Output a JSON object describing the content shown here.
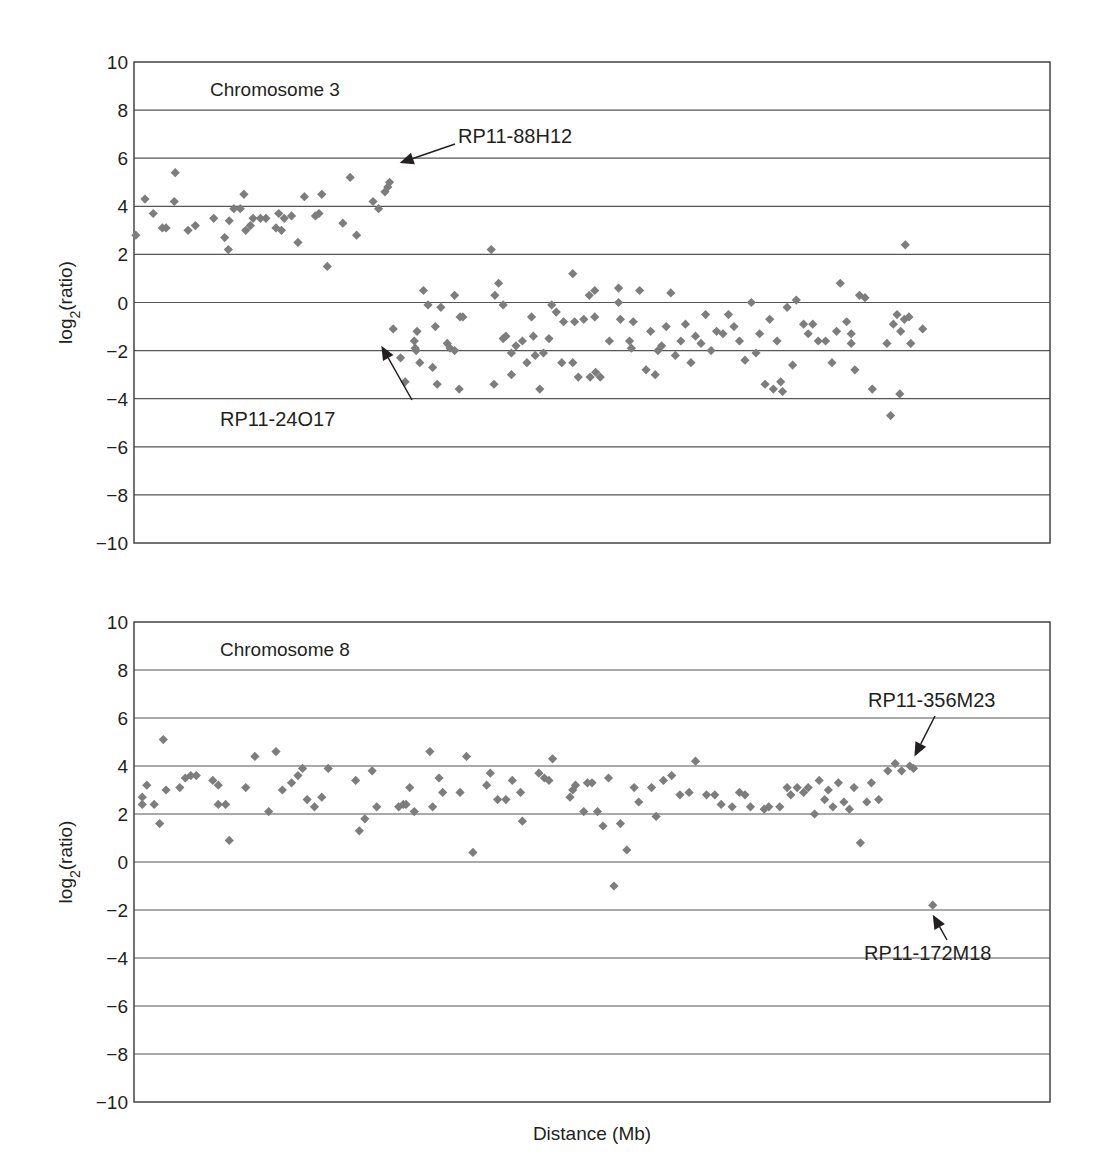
{
  "chart_data": [
    {
      "type": "scatter",
      "title": "Chromosome 3",
      "xlabel": "",
      "ylabel": "log2(ratio)",
      "ylabel_base": "log",
      "ylabel_sub": "2",
      "ylabel_tail": "(ratio)",
      "xlim": [
        0,
        100
      ],
      "ylim": [
        -10,
        10
      ],
      "yticks": [
        10,
        8,
        6,
        4,
        2,
        0,
        -2,
        -4,
        -6,
        -8,
        -10
      ],
      "ytick_labels": [
        "10",
        "8",
        "6",
        "4",
        "2",
        "0",
        "−2",
        "−4",
        "−6",
        "−8",
        "−10"
      ],
      "grid": true,
      "marker": "diamond",
      "color": "#7d7d7d",
      "points": [
        [
          0.2,
          2.8
        ],
        [
          1.2,
          4.3
        ],
        [
          2.1,
          3.7
        ],
        [
          3.1,
          3.1
        ],
        [
          3.5,
          3.1
        ],
        [
          4.5,
          5.4
        ],
        [
          4.4,
          4.2
        ],
        [
          5.9,
          3.0
        ],
        [
          6.7,
          3.2
        ],
        [
          8.7,
          3.5
        ],
        [
          9.9,
          2.7
        ],
        [
          10.3,
          2.2
        ],
        [
          10.4,
          3.4
        ],
        [
          10.9,
          3.9
        ],
        [
          11.6,
          3.9
        ],
        [
          12.0,
          4.5
        ],
        [
          12.2,
          3.0
        ],
        [
          12.7,
          3.2
        ],
        [
          13.0,
          3.5
        ],
        [
          13.8,
          3.5
        ],
        [
          14.4,
          3.5
        ],
        [
          15.5,
          3.1
        ],
        [
          15.8,
          3.7
        ],
        [
          16.1,
          3.0
        ],
        [
          16.4,
          3.5
        ],
        [
          17.2,
          3.6
        ],
        [
          17.9,
          2.5
        ],
        [
          18.6,
          4.4
        ],
        [
          19.8,
          3.6
        ],
        [
          20.2,
          3.7
        ],
        [
          20.5,
          4.5
        ],
        [
          21.1,
          1.5
        ],
        [
          22.8,
          3.3
        ],
        [
          23.6,
          5.2
        ],
        [
          24.3,
          2.8
        ],
        [
          26.1,
          4.2
        ],
        [
          26.7,
          3.9
        ],
        [
          27.4,
          4.6
        ],
        [
          27.7,
          4.8
        ],
        [
          27.9,
          5.0
        ],
        [
          28.3,
          -1.1
        ],
        [
          29.1,
          -2.3
        ],
        [
          29.6,
          -3.3
        ],
        [
          30.6,
          -1.6
        ],
        [
          30.9,
          -1.2
        ],
        [
          30.8,
          -2.0
        ],
        [
          30.7,
          -1.9
        ],
        [
          31.2,
          -2.5
        ],
        [
          31.6,
          0.5
        ],
        [
          32.1,
          -0.1
        ],
        [
          32.6,
          -2.7
        ],
        [
          32.9,
          -1.0
        ],
        [
          33.1,
          -3.4
        ],
        [
          33.5,
          -0.2
        ],
        [
          34.2,
          -1.7
        ],
        [
          34.5,
          -1.9
        ],
        [
          35.0,
          -2.0
        ],
        [
          35.0,
          0.3
        ],
        [
          35.5,
          -3.6
        ],
        [
          35.6,
          -0.6
        ],
        [
          35.9,
          -0.6
        ],
        [
          39.0,
          2.2
        ],
        [
          39.3,
          -3.4
        ],
        [
          39.4,
          0.3
        ],
        [
          39.8,
          0.8
        ],
        [
          40.3,
          -0.1
        ],
        [
          40.3,
          -1.5
        ],
        [
          40.6,
          -1.4
        ],
        [
          41.2,
          -3.0
        ],
        [
          41.2,
          -2.1
        ],
        [
          41.7,
          -1.8
        ],
        [
          42.4,
          -1.6
        ],
        [
          42.9,
          -2.5
        ],
        [
          43.4,
          -0.6
        ],
        [
          43.6,
          -1.4
        ],
        [
          43.8,
          -2.2
        ],
        [
          44.3,
          -3.6
        ],
        [
          44.7,
          -2.1
        ],
        [
          45.3,
          -1.5
        ],
        [
          45.6,
          -0.1
        ],
        [
          46.1,
          -0.4
        ],
        [
          46.7,
          -2.5
        ],
        [
          46.9,
          -0.8
        ],
        [
          47.9,
          1.2
        ],
        [
          47.9,
          -2.5
        ],
        [
          48.1,
          -0.8
        ],
        [
          48.5,
          -3.1
        ],
        [
          49.1,
          -0.7
        ],
        [
          49.8,
          -3.1
        ],
        [
          49.7,
          0.3
        ],
        [
          50.3,
          0.5
        ],
        [
          50.4,
          -2.9
        ],
        [
          50.9,
          -3.1
        ],
        [
          50.3,
          -0.6
        ],
        [
          51.9,
          -1.6
        ],
        [
          52.9,
          0.6
        ],
        [
          52.9,
          0.0
        ],
        [
          53.1,
          -0.7
        ],
        [
          54.1,
          -1.6
        ],
        [
          54.3,
          -1.9
        ],
        [
          54.5,
          -0.8
        ],
        [
          55.2,
          0.5
        ],
        [
          55.9,
          -2.8
        ],
        [
          56.4,
          -1.2
        ],
        [
          56.9,
          -3.0
        ],
        [
          57.2,
          -2.0
        ],
        [
          57.6,
          -1.8
        ],
        [
          58.1,
          -1.0
        ],
        [
          58.6,
          0.4
        ],
        [
          59.1,
          -2.2
        ],
        [
          59.7,
          -1.6
        ],
        [
          60.2,
          -0.9
        ],
        [
          60.8,
          -2.5
        ],
        [
          61.3,
          -1.4
        ],
        [
          61.9,
          -1.7
        ],
        [
          62.4,
          -0.5
        ],
        [
          63.0,
          -2.0
        ],
        [
          63.6,
          -1.2
        ],
        [
          64.3,
          -1.3
        ],
        [
          64.9,
          -0.5
        ],
        [
          65.5,
          -1.0
        ],
        [
          66.1,
          -1.6
        ],
        [
          66.7,
          -2.4
        ],
        [
          67.4,
          0.0
        ],
        [
          67.9,
          -2.1
        ],
        [
          68.3,
          -1.3
        ],
        [
          68.9,
          -3.4
        ],
        [
          69.4,
          -0.7
        ],
        [
          69.8,
          -3.6
        ],
        [
          70.2,
          -1.6
        ],
        [
          70.6,
          -3.3
        ],
        [
          70.8,
          -3.7
        ],
        [
          71.3,
          -0.2
        ],
        [
          71.9,
          -2.6
        ],
        [
          72.3,
          0.1
        ],
        [
          73.1,
          -0.9
        ],
        [
          73.6,
          -1.3
        ],
        [
          74.1,
          -0.9
        ],
        [
          74.7,
          -1.6
        ],
        [
          75.5,
          -1.6
        ],
        [
          76.2,
          -2.5
        ],
        [
          76.7,
          -1.2
        ],
        [
          77.1,
          0.8
        ],
        [
          77.8,
          -0.8
        ],
        [
          78.3,
          -1.7
        ],
        [
          78.3,
          -1.3
        ],
        [
          78.7,
          -2.8
        ],
        [
          79.2,
          0.3
        ],
        [
          79.8,
          0.2
        ],
        [
          80.6,
          -3.6
        ],
        [
          82.2,
          -1.7
        ],
        [
          82.6,
          -4.7
        ],
        [
          82.9,
          -0.9
        ],
        [
          83.3,
          -0.5
        ],
        [
          83.6,
          -3.8
        ],
        [
          83.7,
          -1.2
        ],
        [
          84.1,
          -0.7
        ],
        [
          84.2,
          2.4
        ],
        [
          84.6,
          -0.6
        ],
        [
          84.8,
          -1.7
        ],
        [
          86.1,
          -1.1
        ]
      ],
      "annotations": [
        {
          "text": "RP11-88H12",
          "target": [
            29.0,
            5.8
          ]
        },
        {
          "text": "RP11-24O17",
          "target": [
            27.0,
            -1.8
          ]
        }
      ]
    },
    {
      "type": "scatter",
      "title": "Chromosome 8",
      "xlabel": "Distance (Mb)",
      "ylabel": "log2(ratio)",
      "ylabel_base": "log",
      "ylabel_sub": "2",
      "ylabel_tail": "(ratio)",
      "xlim": [
        0,
        100
      ],
      "ylim": [
        -10,
        10
      ],
      "yticks": [
        10,
        8,
        6,
        4,
        2,
        0,
        -2,
        -4,
        -6,
        -8,
        -10
      ],
      "ytick_labels": [
        "10",
        "8",
        "6",
        "4",
        "2",
        "0",
        "−2",
        "−4",
        "−6",
        "−8",
        "−10"
      ],
      "grid": true,
      "marker": "diamond",
      "color": "#7d7d7d",
      "points": [
        [
          0.9,
          2.4
        ],
        [
          0.9,
          2.7
        ],
        [
          1.4,
          3.2
        ],
        [
          2.2,
          2.4
        ],
        [
          2.8,
          1.6
        ],
        [
          3.2,
          5.1
        ],
        [
          3.5,
          3.0
        ],
        [
          5.0,
          3.1
        ],
        [
          5.6,
          3.5
        ],
        [
          6.2,
          3.6
        ],
        [
          6.8,
          3.6
        ],
        [
          8.6,
          3.4
        ],
        [
          9.2,
          3.2
        ],
        [
          9.2,
          2.4
        ],
        [
          10.0,
          2.4
        ],
        [
          10.4,
          0.9
        ],
        [
          12.2,
          3.1
        ],
        [
          13.2,
          4.4
        ],
        [
          14.7,
          2.1
        ],
        [
          15.5,
          4.6
        ],
        [
          16.2,
          3.0
        ],
        [
          17.2,
          3.3
        ],
        [
          17.9,
          3.6
        ],
        [
          18.4,
          3.9
        ],
        [
          18.9,
          2.6
        ],
        [
          19.7,
          2.3
        ],
        [
          20.5,
          2.7
        ],
        [
          21.2,
          3.9
        ],
        [
          24.2,
          3.4
        ],
        [
          24.6,
          1.3
        ],
        [
          25.2,
          1.8
        ],
        [
          26.0,
          3.8
        ],
        [
          26.5,
          2.3
        ],
        [
          28.9,
          2.3
        ],
        [
          29.4,
          2.4
        ],
        [
          29.7,
          2.4
        ],
        [
          30.1,
          3.1
        ],
        [
          30.6,
          2.1
        ],
        [
          32.3,
          4.6
        ],
        [
          32.6,
          2.3
        ],
        [
          33.3,
          3.5
        ],
        [
          33.7,
          2.9
        ],
        [
          35.6,
          2.9
        ],
        [
          36.3,
          4.4
        ],
        [
          37.0,
          0.4
        ],
        [
          38.5,
          3.2
        ],
        [
          38.9,
          3.7
        ],
        [
          39.7,
          2.6
        ],
        [
          40.6,
          2.6
        ],
        [
          41.3,
          3.4
        ],
        [
          42.2,
          2.9
        ],
        [
          42.4,
          1.7
        ],
        [
          44.2,
          3.7
        ],
        [
          44.8,
          3.5
        ],
        [
          45.3,
          3.4
        ],
        [
          45.7,
          4.3
        ],
        [
          47.6,
          2.7
        ],
        [
          47.9,
          3.0
        ],
        [
          48.2,
          3.2
        ],
        [
          49.1,
          2.1
        ],
        [
          49.5,
          3.3
        ],
        [
          50.0,
          3.3
        ],
        [
          50.6,
          2.1
        ],
        [
          51.2,
          1.5
        ],
        [
          51.8,
          3.5
        ],
        [
          52.4,
          -1.0
        ],
        [
          53.1,
          1.6
        ],
        [
          53.8,
          0.5
        ],
        [
          54.6,
          3.1
        ],
        [
          55.1,
          2.5
        ],
        [
          56.5,
          3.1
        ],
        [
          57.0,
          1.9
        ],
        [
          57.8,
          3.4
        ],
        [
          58.7,
          3.6
        ],
        [
          59.6,
          2.8
        ],
        [
          60.6,
          2.9
        ],
        [
          61.3,
          4.2
        ],
        [
          62.5,
          2.8
        ],
        [
          63.4,
          2.8
        ],
        [
          64.1,
          2.4
        ],
        [
          65.3,
          2.3
        ],
        [
          66.1,
          2.9
        ],
        [
          66.7,
          2.8
        ],
        [
          67.3,
          2.3
        ],
        [
          68.8,
          2.2
        ],
        [
          69.3,
          2.3
        ],
        [
          70.5,
          2.3
        ],
        [
          71.3,
          3.1
        ],
        [
          71.7,
          2.8
        ],
        [
          72.4,
          3.1
        ],
        [
          73.1,
          2.9
        ],
        [
          73.6,
          3.1
        ],
        [
          74.3,
          2.0
        ],
        [
          74.8,
          3.4
        ],
        [
          75.4,
          2.6
        ],
        [
          75.8,
          3.0
        ],
        [
          76.3,
          2.3
        ],
        [
          76.9,
          3.3
        ],
        [
          77.5,
          2.5
        ],
        [
          78.1,
          2.2
        ],
        [
          78.6,
          3.1
        ],
        [
          79.3,
          0.8
        ],
        [
          80.0,
          2.5
        ],
        [
          80.5,
          3.3
        ],
        [
          81.3,
          2.6
        ],
        [
          82.3,
          3.8
        ],
        [
          83.1,
          4.1
        ],
        [
          83.8,
          3.8
        ],
        [
          84.7,
          4.0
        ],
        [
          85.1,
          3.9
        ],
        [
          87.2,
          -1.8
        ]
      ],
      "annotations": [
        {
          "text": "RP11-356M23",
          "target": [
            85.2,
            4.4
          ]
        },
        {
          "text": "RP11-172M18",
          "target": [
            87.2,
            -2.2
          ]
        }
      ]
    }
  ]
}
